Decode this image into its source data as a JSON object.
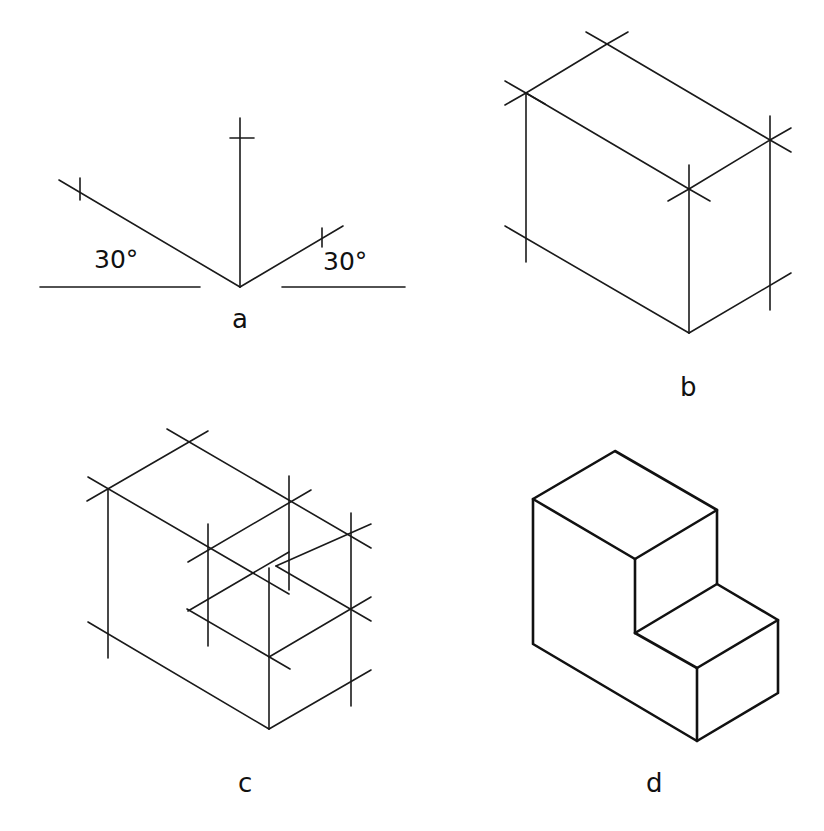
{
  "figure": {
    "panels": [
      {
        "id": "a",
        "label": "a",
        "description": "Isometric axes at 30 degrees"
      },
      {
        "id": "b",
        "label": "b",
        "description": "Enclosing box with marked corners"
      },
      {
        "id": "c",
        "label": "c",
        "description": "Step notch construction lines"
      },
      {
        "id": "d",
        "label": "d",
        "description": "Finished isometric object"
      }
    ],
    "angle_labels": {
      "left": "30°",
      "right": "30°"
    }
  }
}
